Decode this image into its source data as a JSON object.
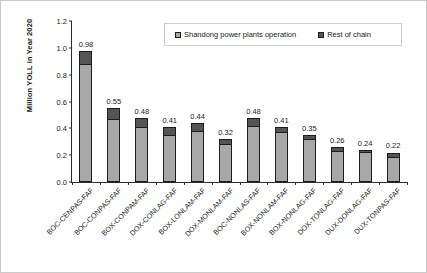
{
  "chart_data": {
    "type": "bar",
    "subtype": "stacked-column",
    "title": "",
    "xlabel": "",
    "ylabel": "Million YOLL in Year 2020",
    "ylim": [
      0,
      1.2
    ],
    "ytick_values": [
      0.0,
      0.2,
      0.4,
      0.6,
      0.8,
      1.0,
      1.2
    ],
    "ytick_labels": [
      "0.0",
      "0.2",
      "0.4",
      "0.6",
      "0.8",
      "1.0",
      "1.2"
    ],
    "grid": false,
    "legend_position": "top-right-inside",
    "categories": [
      "BOC-CENPAS-FAF",
      "BOC-CONPAS-FAF",
      "BOX-CONPAM-FAF",
      "DOX-CONLAG-FAF",
      "BOX-LONLAM-FAF",
      "DOX-MONLAM-FAF",
      "BOC-NONLAS-FAF",
      "BOX-NONLAM-FAF",
      "BOX-NONLAG-FAF",
      "DOX-TONLAG-FAF",
      "DUX-DONLAG-FAF",
      "DUX-TONPAS-FAF"
    ],
    "series": [
      {
        "name": "Shandong power plants operation",
        "color": "#a8a8a8",
        "values": [
          0.88,
          0.47,
          0.41,
          0.35,
          0.38,
          0.28,
          0.42,
          0.37,
          0.32,
          0.23,
          0.22,
          0.19
        ]
      },
      {
        "name": "Rest of chain",
        "color": "#545454",
        "values": [
          0.1,
          0.08,
          0.07,
          0.06,
          0.06,
          0.04,
          0.06,
          0.04,
          0.03,
          0.03,
          0.02,
          0.03
        ]
      }
    ],
    "totals": [
      0.98,
      0.55,
      0.48,
      0.41,
      0.44,
      0.32,
      0.48,
      0.41,
      0.35,
      0.26,
      0.24,
      0.22
    ],
    "total_labels": [
      "0.98",
      "0.55",
      "0.48",
      "0.41",
      "0.44",
      "0.32",
      "0.48",
      "0.41",
      "0.35",
      "0.26",
      "0.24",
      "0.22"
    ]
  },
  "legend": {
    "items": [
      {
        "label": "Shandong power plants operation"
      },
      {
        "label": "Rest of chain"
      }
    ]
  }
}
